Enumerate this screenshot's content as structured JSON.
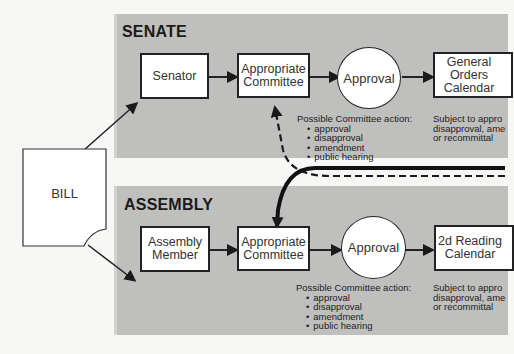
{
  "senate": {
    "title": "SENATE",
    "senator": "Senator",
    "committee": "Appropriate Committee",
    "approval": "Approval",
    "calendar": "General Orders Calendar",
    "committee_actions_label": "Possible Committee action:",
    "committee_actions": [
      "approval",
      "disapproval",
      "amendment",
      "public hearing"
    ],
    "calendar_note": [
      "Subject to appro",
      "disapproval, ame",
      "or recommittal"
    ]
  },
  "assembly": {
    "title": "ASSEMBLY",
    "member": "Assembly Member",
    "committee": "Appropriate Committee",
    "approval": "Approval",
    "calendar": "2d Reading Calendar",
    "committee_actions_label": "Possible Committee action:",
    "committee_actions": [
      "approval",
      "disapproval",
      "amendment",
      "public hearing"
    ],
    "calendar_note": [
      "Subject to appro",
      "disapproval, ame",
      "or recommittal"
    ]
  },
  "bill": {
    "label": "BILL"
  },
  "colors": {
    "panel": "#bfbfbd",
    "line": "#222222",
    "box": "#ffffff"
  }
}
